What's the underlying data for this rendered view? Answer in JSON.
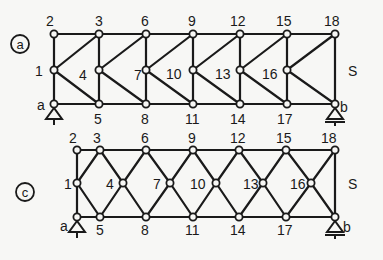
{
  "diagrams": [
    {
      "id": "a",
      "tag": "a",
      "tag_pos": [
        20,
        44
      ],
      "nodes": {
        "2": [
          54,
          34
        ],
        "1": [
          54,
          70
        ],
        "a": [
          54,
          104
        ],
        "3": [
          99,
          34
        ],
        "4": [
          99,
          70
        ],
        "5": [
          99,
          104
        ],
        "6": [
          146,
          34
        ],
        "7": [
          146,
          70
        ],
        "8": [
          146,
          104
        ],
        "9": [
          193,
          34
        ],
        "10": [
          193,
          70
        ],
        "11": [
          193,
          104
        ],
        "12": [
          240,
          34
        ],
        "13": [
          240,
          70
        ],
        "14": [
          240,
          104
        ],
        "15": [
          287,
          34
        ],
        "16": [
          287,
          70
        ],
        "17": [
          287,
          104
        ],
        "18": [
          335,
          34
        ],
        "b": [
          335,
          104
        ]
      },
      "members": [
        [
          "2",
          "3"
        ],
        [
          "3",
          "6"
        ],
        [
          "6",
          "9"
        ],
        [
          "9",
          "12"
        ],
        [
          "12",
          "15"
        ],
        [
          "15",
          "18"
        ],
        [
          "a",
          "5"
        ],
        [
          "5",
          "8"
        ],
        [
          "8",
          "11"
        ],
        [
          "11",
          "14"
        ],
        [
          "14",
          "17"
        ],
        [
          "17",
          "b"
        ],
        [
          "2",
          "1"
        ],
        [
          "1",
          "a"
        ],
        [
          "3",
          "4"
        ],
        [
          "4",
          "5"
        ],
        [
          "6",
          "7"
        ],
        [
          "7",
          "8"
        ],
        [
          "9",
          "10"
        ],
        [
          "10",
          "11"
        ],
        [
          "12",
          "13"
        ],
        [
          "13",
          "14"
        ],
        [
          "15",
          "16"
        ],
        [
          "16",
          "17"
        ],
        [
          "18",
          "b"
        ],
        [
          "1",
          "3"
        ],
        [
          "1",
          "5"
        ],
        [
          "4",
          "6"
        ],
        [
          "4",
          "8"
        ],
        [
          "7",
          "9"
        ],
        [
          "7",
          "11"
        ],
        [
          "10",
          "12"
        ],
        [
          "10",
          "14"
        ],
        [
          "13",
          "15"
        ],
        [
          "13",
          "17"
        ],
        [
          "16",
          "18"
        ],
        [
          "16",
          "b"
        ]
      ],
      "labels": [
        {
          "text": "2",
          "x": 46,
          "y": 26
        },
        {
          "text": "3",
          "x": 95,
          "y": 26
        },
        {
          "text": "6",
          "x": 141,
          "y": 26
        },
        {
          "text": "9",
          "x": 188,
          "y": 26
        },
        {
          "text": "12",
          "x": 230,
          "y": 26
        },
        {
          "text": "15",
          "x": 276,
          "y": 26
        },
        {
          "text": "18",
          "x": 324,
          "y": 26
        },
        {
          "text": "1",
          "x": 35,
          "y": 76
        },
        {
          "text": "4",
          "x": 79,
          "y": 80
        },
        {
          "text": "7",
          "x": 134,
          "y": 80
        },
        {
          "text": "10",
          "x": 166,
          "y": 79
        },
        {
          "text": "13",
          "x": 215,
          "y": 79
        },
        {
          "text": "16",
          "x": 262,
          "y": 79
        },
        {
          "text": "S",
          "x": 348,
          "y": 76
        },
        {
          "text": "a",
          "x": 37,
          "y": 110
        },
        {
          "text": "5",
          "x": 94,
          "y": 124
        },
        {
          "text": "8",
          "x": 141,
          "y": 124
        },
        {
          "text": "11",
          "x": 185,
          "y": 124
        },
        {
          "text": "14",
          "x": 230,
          "y": 124
        },
        {
          "text": "17",
          "x": 277,
          "y": 124
        },
        {
          "text": "b",
          "x": 340,
          "y": 112
        }
      ],
      "supports": {
        "a": "pin",
        "b": "roller"
      }
    },
    {
      "id": "c",
      "tag": "c",
      "tag_pos": [
        25,
        192
      ],
      "nodes": {
        "2": [
          77,
          150
        ],
        "1": [
          77,
          183
        ],
        "a": [
          77,
          217
        ],
        "3": [
          100,
          150
        ],
        "5": [
          100,
          217
        ],
        "4": [
          123,
          183
        ],
        "6": [
          146,
          150
        ],
        "8": [
          146,
          217
        ],
        "7": [
          170,
          183
        ],
        "9": [
          193,
          150
        ],
        "11": [
          193,
          217
        ],
        "10": [
          216,
          183
        ],
        "12": [
          239,
          150
        ],
        "14": [
          239,
          217
        ],
        "13": [
          263,
          183
        ],
        "15": [
          286,
          150
        ],
        "17": [
          286,
          217
        ],
        "16": [
          311,
          183
        ],
        "18": [
          335,
          150
        ],
        "b": [
          335,
          217
        ]
      },
      "members": [
        [
          "2",
          "3"
        ],
        [
          "3",
          "6"
        ],
        [
          "6",
          "9"
        ],
        [
          "9",
          "12"
        ],
        [
          "12",
          "15"
        ],
        [
          "15",
          "18"
        ],
        [
          "a",
          "5"
        ],
        [
          "5",
          "8"
        ],
        [
          "8",
          "11"
        ],
        [
          "11",
          "14"
        ],
        [
          "14",
          "17"
        ],
        [
          "17",
          "b"
        ],
        [
          "2",
          "1"
        ],
        [
          "1",
          "a"
        ],
        [
          "18",
          "b"
        ],
        [
          "1",
          "3"
        ],
        [
          "1",
          "5"
        ],
        [
          "3",
          "4"
        ],
        [
          "4",
          "5"
        ],
        [
          "4",
          "6"
        ],
        [
          "4",
          "8"
        ],
        [
          "6",
          "7"
        ],
        [
          "7",
          "8"
        ],
        [
          "7",
          "9"
        ],
        [
          "7",
          "11"
        ],
        [
          "9",
          "10"
        ],
        [
          "10",
          "11"
        ],
        [
          "10",
          "12"
        ],
        [
          "10",
          "14"
        ],
        [
          "12",
          "13"
        ],
        [
          "13",
          "14"
        ],
        [
          "13",
          "15"
        ],
        [
          "13",
          "17"
        ],
        [
          "15",
          "16"
        ],
        [
          "16",
          "17"
        ],
        [
          "16",
          "18"
        ],
        [
          "16",
          "b"
        ]
      ],
      "labels": [
        {
          "text": "2",
          "x": 69,
          "y": 143
        },
        {
          "text": "3",
          "x": 93,
          "y": 143
        },
        {
          "text": "6",
          "x": 141,
          "y": 143
        },
        {
          "text": "9",
          "x": 188,
          "y": 143
        },
        {
          "text": "12",
          "x": 230,
          "y": 143
        },
        {
          "text": "15",
          "x": 276,
          "y": 143
        },
        {
          "text": "18",
          "x": 321,
          "y": 143
        },
        {
          "text": "1",
          "x": 64,
          "y": 189
        },
        {
          "text": "4",
          "x": 106,
          "y": 189
        },
        {
          "text": "7",
          "x": 153,
          "y": 189
        },
        {
          "text": "10",
          "x": 190,
          "y": 189
        },
        {
          "text": "13",
          "x": 243,
          "y": 189
        },
        {
          "text": "16",
          "x": 290,
          "y": 189
        },
        {
          "text": "S",
          "x": 348,
          "y": 189
        },
        {
          "text": "a",
          "x": 60,
          "y": 231
        },
        {
          "text": "5",
          "x": 96,
          "y": 235
        },
        {
          "text": "8",
          "x": 141,
          "y": 235
        },
        {
          "text": "11",
          "x": 185,
          "y": 235
        },
        {
          "text": "14",
          "x": 230,
          "y": 235
        },
        {
          "text": "17",
          "x": 277,
          "y": 235
        },
        {
          "text": "b",
          "x": 343,
          "y": 232
        }
      ],
      "supports": {
        "a": "pin",
        "b": "roller"
      }
    }
  ],
  "colors": {
    "ink": "#1a1a1a",
    "paper": "#f7f7f5"
  }
}
